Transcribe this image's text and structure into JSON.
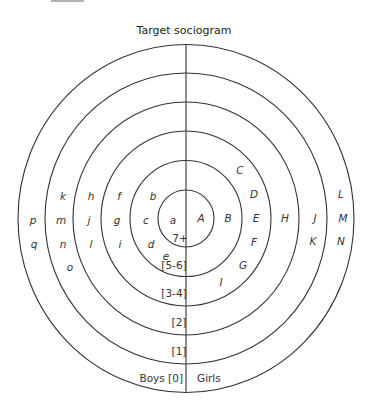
{
  "title": "Target sociogram",
  "center": {
    "x": 186,
    "y": 218.5
  },
  "rings": [
    {
      "rx": 168,
      "ry": 174
    },
    {
      "rx": 141,
      "ry": 145.5
    },
    {
      "rx": 113,
      "ry": 116.5
    },
    {
      "rx": 85,
      "ry": 87.5
    },
    {
      "rx": 56,
      "ry": 58
    },
    {
      "rx": 28,
      "ry": 28.5
    }
  ],
  "bands": [
    {
      "id": "7plus",
      "text": "7+",
      "x": 180,
      "y": 242
    },
    {
      "id": "5-6",
      "text": "[5-6]",
      "x": 174,
      "y": 269
    },
    {
      "id": "3-4",
      "text": "[3-4]",
      "x": 174,
      "y": 297
    },
    {
      "id": "2",
      "text": "[2]",
      "x": 179,
      "y": 326
    },
    {
      "id": "1",
      "text": "[1]",
      "x": 179,
      "y": 355
    }
  ],
  "bottom": {
    "boys": "Boys [0]",
    "girls": "Girls"
  },
  "boys": [
    {
      "name": "a",
      "x": 173,
      "y": 220
    },
    {
      "name": "b",
      "x": 153,
      "y": 196
    },
    {
      "name": "c",
      "x": 146,
      "y": 220
    },
    {
      "name": "d",
      "x": 151,
      "y": 244
    },
    {
      "name": "e",
      "x": 166,
      "y": 256
    },
    {
      "name": "f",
      "x": 119,
      "y": 196
    },
    {
      "name": "g",
      "x": 117,
      "y": 220
    },
    {
      "name": "i",
      "x": 120,
      "y": 244
    },
    {
      "name": "h",
      "x": 91,
      "y": 196
    },
    {
      "name": "j",
      "x": 89,
      "y": 220
    },
    {
      "name": "l",
      "x": 91,
      "y": 244
    },
    {
      "name": "k",
      "x": 63,
      "y": 196
    },
    {
      "name": "m",
      "x": 61,
      "y": 220
    },
    {
      "name": "n",
      "x": 63,
      "y": 244
    },
    {
      "name": "o",
      "x": 70,
      "y": 267
    },
    {
      "name": "p",
      "x": 33,
      "y": 220
    },
    {
      "name": "q",
      "x": 34,
      "y": 244
    }
  ],
  "girls": [
    {
      "name": "A",
      "x": 201,
      "y": 218
    },
    {
      "name": "B",
      "x": 228,
      "y": 218
    },
    {
      "name": "C",
      "x": 240,
      "y": 170
    },
    {
      "name": "D",
      "x": 254,
      "y": 194
    },
    {
      "name": "E",
      "x": 256,
      "y": 218
    },
    {
      "name": "F",
      "x": 254,
      "y": 242
    },
    {
      "name": "G",
      "x": 243,
      "y": 265
    },
    {
      "name": "I",
      "x": 221,
      "y": 282
    },
    {
      "name": "H",
      "x": 285,
      "y": 218
    },
    {
      "name": "J",
      "x": 315,
      "y": 218
    },
    {
      "name": "K",
      "x": 313,
      "y": 241
    },
    {
      "name": "L",
      "x": 341,
      "y": 194
    },
    {
      "name": "M",
      "x": 343,
      "y": 218
    },
    {
      "name": "N",
      "x": 341,
      "y": 241
    }
  ]
}
